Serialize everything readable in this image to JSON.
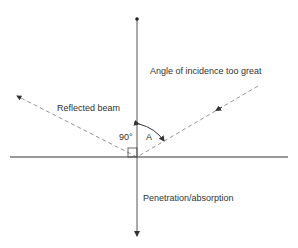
{
  "diagram": {
    "labels": {
      "incidence": "Angle of incidence too great",
      "reflected": "Reflected beam",
      "right_angle": "90°",
      "angle": "A",
      "penetration": "Penetration/absorption"
    },
    "colors": {
      "line": "#444444",
      "dashed": "#888888",
      "text": "#333333"
    }
  }
}
